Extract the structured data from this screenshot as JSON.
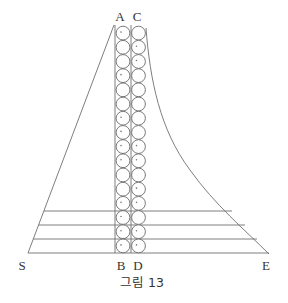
{
  "figure": {
    "caption": "그림 13",
    "labels": {
      "A": "A",
      "C": "C",
      "B": "B",
      "D": "D",
      "S": "S",
      "E": "E"
    },
    "columns": {
      "count_per_column": 16,
      "left_column_dots": [
        1,
        0,
        0,
        1,
        0,
        0,
        1,
        1,
        1,
        1,
        0,
        0,
        1,
        1,
        1,
        1
      ],
      "right_column_dots": [
        0,
        1,
        1,
        0,
        0,
        0,
        0,
        0,
        1,
        1,
        0,
        1,
        1,
        0,
        1,
        1
      ]
    },
    "horizontal_lines": 4,
    "colors": {
      "line": "#6f6f6f",
      "text": "#333333",
      "background": "#ffffff"
    }
  }
}
